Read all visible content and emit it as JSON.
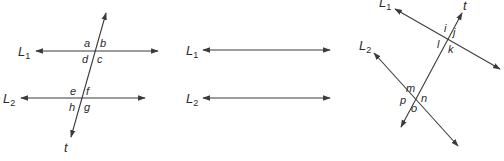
{
  "figures": [
    {
      "id": "figure-1",
      "lines": [
        {
          "name": "L",
          "sub": "1"
        },
        {
          "name": "L",
          "sub": "2"
        },
        {
          "name": "t",
          "sub": ""
        }
      ],
      "angle_labels": [
        "a",
        "b",
        "c",
        "d",
        "e",
        "f",
        "g",
        "h"
      ]
    },
    {
      "id": "figure-2",
      "lines": [
        {
          "name": "L",
          "sub": "1"
        },
        {
          "name": "L",
          "sub": "2"
        }
      ]
    },
    {
      "id": "figure-3",
      "lines": [
        {
          "name": "L",
          "sub": "1"
        },
        {
          "name": "L",
          "sub": "2"
        },
        {
          "name": "t",
          "sub": ""
        }
      ],
      "angle_labels": [
        "i",
        "j",
        "k",
        "l",
        "m",
        "n",
        "o",
        "p"
      ]
    }
  ],
  "colors": {
    "line": "#3a3a3a",
    "text": "#2a2a2a",
    "background": "#ffffff"
  }
}
